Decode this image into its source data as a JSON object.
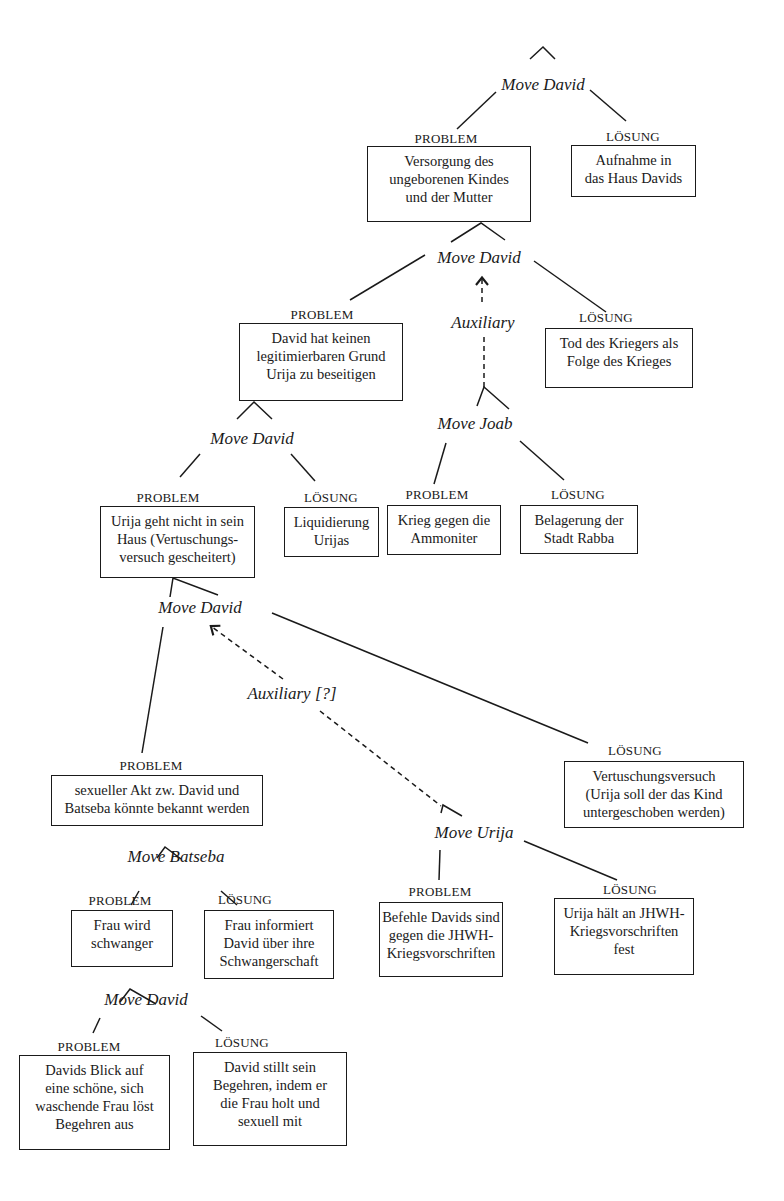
{
  "diagram": {
    "type": "problem-solution move tree",
    "labels": {
      "problem": "PROBLEM",
      "solution": "LÖSUNG"
    },
    "nodes": {
      "move_root": "Move David",
      "p1": [
        "Versorgung des",
        "ungeborenen Kindes",
        "und der Mutter"
      ],
      "s1": [
        "Aufnahme in",
        "das Haus Davids"
      ],
      "move2": "Move David",
      "aux1": "Auxiliary",
      "p2": [
        "David hat keinen",
        "legitimierbaren Grund",
        "Urija zu beseitigen"
      ],
      "s2": [
        "Tod des Kriegers als",
        "Folge des Krieges"
      ],
      "move_joab": "Move Joab",
      "pj": [
        "Krieg gegen die",
        "Ammoniter"
      ],
      "sj": [
        "Belagerung der",
        "Stadt Rabba"
      ],
      "move3": "Move David",
      "p3": [
        "Urija geht nicht in sein",
        "Haus (Vertuschungs-",
        "versuch gescheitert)"
      ],
      "s3": [
        "Liquidierung",
        "Urijas"
      ],
      "move4": "Move David",
      "aux2": "Auxiliary [?]",
      "p4": [
        "sexueller Akt zw. David und",
        "Batseba könnte bekannt werden"
      ],
      "s4": [
        "Vertuschungsversuch",
        "(Urija soll der das Kind",
        "untergeschoben werden)"
      ],
      "move_batseba": "Move Batseba",
      "pb": [
        "Frau wird",
        "schwanger"
      ],
      "sb": [
        "Frau informiert",
        "David  über ihre",
        "Schwangerschaft"
      ],
      "move_urija": "Move Urija",
      "pu": [
        "Befehle Davids sind",
        "gegen die JHWH-",
        "Kriegsvorschriften"
      ],
      "su": [
        "Urija hält an JHWH-",
        "Kriegsvorschriften",
        "fest"
      ],
      "move5": "Move David",
      "p5": [
        "Davids Blick auf",
        "eine schöne, sich",
        "waschende Frau löst",
        "Begehren aus"
      ],
      "s5": [
        "David stillt sein",
        "Begehren, indem er",
        "die Frau holt und",
        "sexuell mit"
      ]
    }
  }
}
